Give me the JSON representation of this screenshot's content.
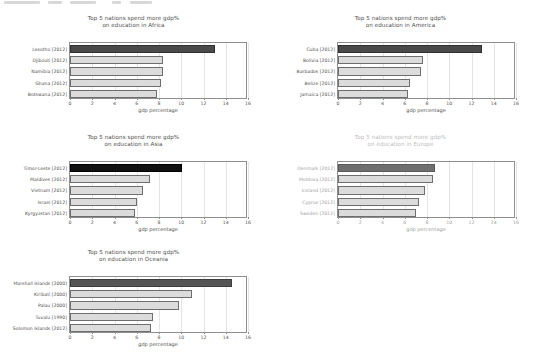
{
  "figure": {
    "background": "#ffffff",
    "text_color": "#4f4f4f",
    "highlight_color": "#4a4a4a",
    "bar_color": "#dcdcdc",
    "bar_edge_color": "#6e6e6e",
    "grid_color": "#e4e4e4",
    "axis_color": "#8f8f8f",
    "faded_color": "#bdbdbd"
  },
  "chart_data": [
    {
      "type": "bar",
      "orientation": "horizontal",
      "panel": "africa",
      "title": "Top 5 nations spend more gdp%\non education in Africa",
      "title_line1": "Top 5 nations spend more gdp%",
      "title_line2": "on education in Africa",
      "xlabel": "gdp percentage",
      "ylabel": "",
      "xlim": [
        0,
        16
      ],
      "xticks": [
        0,
        2,
        4,
        6,
        8,
        10,
        12,
        14,
        16
      ],
      "xticklabels": [
        "0",
        "2",
        "4",
        "6",
        "8",
        "10",
        "12",
        "14",
        "16"
      ],
      "grid": true,
      "legend": "none",
      "faded": false,
      "categories": [
        "Lesotho [2012]",
        "Djibouti [2012]",
        "Namibia [2012]",
        "Ghana [2012]",
        "Botswana [2012]"
      ],
      "values": [
        13.0,
        8.4,
        8.4,
        8.2,
        7.8
      ],
      "highlight_index": 0
    },
    {
      "type": "bar",
      "orientation": "horizontal",
      "panel": "america",
      "title": "Top 5 nations spend more gdp%\non education in America",
      "title_line1": "Top 5 nations spend more gdp%",
      "title_line2": "on education in America",
      "xlabel": "gdp percentage",
      "ylabel": "",
      "xlim": [
        0,
        16
      ],
      "xticks": [
        0,
        2,
        4,
        6,
        8,
        10,
        12,
        14,
        16
      ],
      "xticklabels": [
        "0",
        "2",
        "4",
        "6",
        "8",
        "10",
        "12",
        "14",
        "16"
      ],
      "grid": true,
      "legend": "none",
      "faded": false,
      "categories": [
        "Cuba [2012]",
        "Bolivia [2012]",
        "Barbados [2012]",
        "Belize [2012]",
        "Jamaica [2012]"
      ],
      "values": [
        12.9,
        7.6,
        7.5,
        6.5,
        6.3
      ],
      "highlight_index": 0
    },
    {
      "type": "bar",
      "orientation": "horizontal",
      "panel": "asia",
      "title": "Top 5 nations spend more gdp%\non education in Asia",
      "title_line1": "Top 5 nations spend more gdp%",
      "title_line2": "on education in Asia",
      "xlabel": "gdp percentage",
      "ylabel": "",
      "xlim": [
        0,
        16
      ],
      "xticks": [
        0,
        2,
        4,
        6,
        8,
        10,
        12,
        14,
        16
      ],
      "xticklabels": [
        "0",
        "2",
        "4",
        "6",
        "8",
        "10",
        "12",
        "14",
        "16"
      ],
      "grid": true,
      "legend": "none",
      "faded": false,
      "categories": [
        "Timor-Leste [2012]",
        "Maldives [2012]",
        "Vietnam [2012]",
        "Israel [2012]",
        "Kyrgyzstan [2012]"
      ],
      "values": [
        10.1,
        7.2,
        6.6,
        6.0,
        5.8
      ],
      "highlight_index": 0
    },
    {
      "type": "bar",
      "orientation": "horizontal",
      "panel": "europe",
      "title": "Top 5 nations spend more gdp%\non education in Europe",
      "title_line1": "Top 5 nations spend more gdp%",
      "title_line2": "on education in Europe",
      "xlabel": "gdp percentage",
      "ylabel": "",
      "xlim": [
        0,
        16
      ],
      "xticks": [
        0,
        2,
        4,
        6,
        8,
        10,
        12,
        14,
        16
      ],
      "xticklabels": [
        "0",
        "2",
        "4",
        "6",
        "8",
        "10",
        "12",
        "14",
        "16"
      ],
      "grid": true,
      "legend": "none",
      "faded": true,
      "categories": [
        "Denmark [2012]",
        "Moldova [2012]",
        "Iceland [2012]",
        "Cyprus [2012]",
        "Sweden [2012]"
      ],
      "values": [
        8.7,
        8.5,
        7.8,
        7.3,
        7.0
      ],
      "highlight_index": 0
    },
    {
      "type": "bar",
      "orientation": "horizontal",
      "panel": "oceania",
      "title": "Top 5 nations spend more gdp%\non education in Oceania",
      "title_line1": "Top 5 nations spend more gdp%",
      "title_line2": "on education in Oceania",
      "xlabel": "gdp percentage",
      "ylabel": "",
      "xlim": [
        0,
        16
      ],
      "xticks": [
        0,
        2,
        4,
        6,
        8,
        10,
        12,
        14,
        16
      ],
      "xticklabels": [
        "0",
        "2",
        "4",
        "6",
        "8",
        "10",
        "12",
        "14",
        "16"
      ],
      "grid": true,
      "legend": "none",
      "faded": false,
      "categories": [
        "Marshall Islands [2000]",
        "Kiribati [2000]",
        "Palau [2000]",
        "Tuvalu [1990]",
        "Solomon Islands [2012]"
      ],
      "values": [
        14.6,
        11.0,
        9.8,
        7.5,
        7.3
      ],
      "highlight_index": 0
    }
  ]
}
